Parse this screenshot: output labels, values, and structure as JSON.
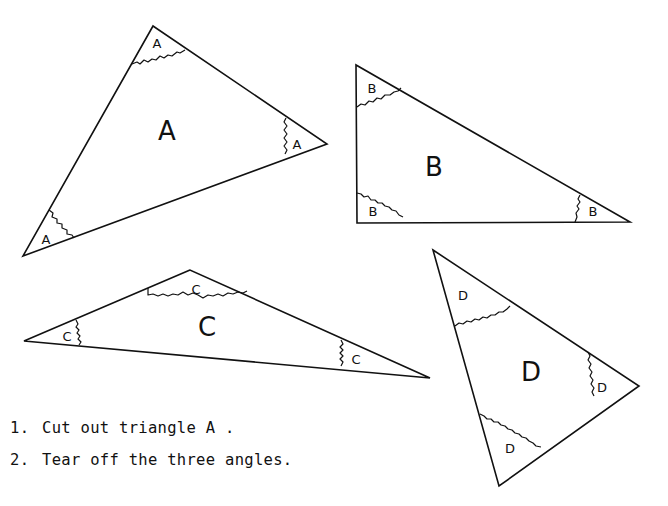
{
  "diagram": {
    "stroke_color": "#111111",
    "background": "#ffffff",
    "triangles": [
      {
        "id": "A",
        "label": "A",
        "vertices": [
          [
            153,
            26
          ],
          [
            327,
            144
          ],
          [
            23,
            256
          ]
        ],
        "label_pos": [
          167,
          131
        ],
        "angle_labels": [
          {
            "label": "A",
            "pos": [
              157,
              43
            ]
          },
          {
            "label": "A",
            "pos": [
              297,
              144
            ]
          },
          {
            "label": "A",
            "pos": [
              46,
              239
            ]
          }
        ],
        "tear_lines": [
          "M132,64 l5,-2 l3,2 l4,-4 l4,2 l4,-3 l4,1 l4,-4 l4,2 l4,-3 l4,1 l5,-4 l3,1 l5,-3",
          "M286,118 l-2,4 l3,4 l-3,4 l3,4 l-3,4 l3,4 l-3,4 l3,4 l-2,4",
          "M49,210 l4,3 l-1,4 l5,2 l0,4 l5,1 l0,4 l5,2 l0,4 l5,1 l2,3"
        ]
      },
      {
        "id": "B",
        "label": "B",
        "vertices": [
          [
            356,
            65
          ],
          [
            357,
            223
          ],
          [
            630,
            222
          ]
        ],
        "label_pos": [
          434,
          167
        ],
        "angle_labels": [
          {
            "label": "B",
            "pos": [
              372,
              88
            ]
          },
          {
            "label": "B",
            "pos": [
              373,
              211
            ]
          },
          {
            "label": "B",
            "pos": [
              593,
              211
            ]
          }
        ],
        "tear_lines": [
          "M357,107 l4,-3 l4,1 l4,-4 l4,1 l4,-4 l4,1 l4,-4 l5,0 l4,-3 l4,-1 l3,-3",
          "M357,193 l4,1 l3,3 l4,-1 l3,4 l4,0 l3,3 l4,0 l3,3 l4,1 l3,3 l4,1 l3,4 l4,2",
          "M580,195 l-2,4 l2,3 l-3,4 l2,3 l-3,4 l1,4 l-2,5"
        ]
      },
      {
        "id": "C",
        "label": "C",
        "vertices": [
          [
            190,
            270
          ],
          [
            24,
            341
          ],
          [
            430,
            378
          ]
        ],
        "label_pos": [
          207,
          327
        ],
        "angle_labels": [
          {
            "label": "C",
            "pos": [
              196,
              289
            ]
          },
          {
            "label": "C",
            "pos": [
              67,
              336
            ]
          },
          {
            "label": "C",
            "pos": [
              356,
              359
            ]
          }
        ],
        "tear_lines": [
          "M148,288 l0,7 l5,-1 l5,2 l5,-2 l5,2 l5,-2 l5,1 l5,-3 l5,3 l5,-2 l5,2 l5,3 l5,-3 l5,1 l5,-2 l5,2 l5,-3 l5,1 l5,-2 l5,1 l4,-2",
          "M76,320 l2,4 l-2,3 l3,3 l-2,3 l3,3 l-2,3 l3,3 l-2,3",
          "M341,340 l2,4 l-3,3 l3,3 l-3,3 l3,3 l-3,3 l3,3 l-2,4"
        ]
      },
      {
        "id": "D",
        "label": "D",
        "vertices": [
          [
            433,
            250
          ],
          [
            639,
            386
          ],
          [
            499,
            486
          ]
        ],
        "label_pos": [
          531,
          372
        ],
        "angle_labels": [
          {
            "label": "D",
            "pos": [
              463,
              295
            ]
          },
          {
            "label": "D",
            "pos": [
              602,
              387
            ]
          },
          {
            "label": "D",
            "pos": [
              510,
              448
            ]
          }
        ],
        "tear_lines": [
          "M455,326 l4,-3 l4,1 l4,-3 l4,1 l4,-3 l4,1 l4,-3 l4,1 l4,-3 l4,0 l4,-3 l4,0 l4,-3 l3,-3",
          "M588,352 l2,4 l-2,4 l3,4 l-2,4 l3,4 l-2,4 l3,4 l-2,4 l3,4 l-2,4 l2,4",
          "M480,414 l4,2 l3,3 l4,0 l3,3 l4,0 l3,3 l4,1 l3,3 l4,1 l3,3 l4,1 l3,3 l4,1 l3,3 l4,2 l3,3 l5,1"
        ]
      }
    ]
  },
  "instructions": [
    {
      "number": "1.",
      "text": "Cut out triangle A ."
    },
    {
      "number": "2.",
      "text": "Tear off the three angles."
    }
  ]
}
